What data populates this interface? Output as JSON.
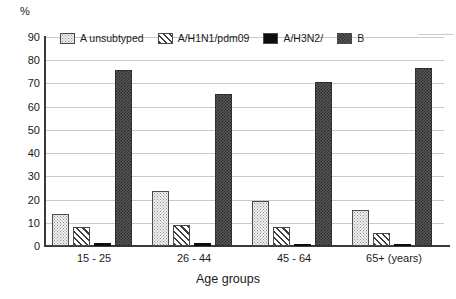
{
  "chart_data": {
    "type": "bar",
    "title": "",
    "subtitle": "",
    "xlabel": "Age groups",
    "ylabel": "%",
    "ylim": [
      0,
      90
    ],
    "ytick_step": 10,
    "yticks": [
      "90",
      "80",
      "70",
      "60",
      "50",
      "40",
      "30",
      "20",
      "10",
      "0"
    ],
    "grid": true,
    "legend_position": "top",
    "categories": [
      "15 - 25",
      "26 - 44",
      "45 - 64",
      "65+ (years)"
    ],
    "series": [
      {
        "name": "A unsubtyped",
        "pattern": "dots-light",
        "color": "#f2f2f2",
        "values": [
          14,
          23.5,
          19.5,
          15.5
        ]
      },
      {
        "name": "A/H1N1/pdm09",
        "pattern": "diagonal-hatch",
        "color": "#ffffff",
        "values": [
          8,
          9,
          8,
          5.5
        ]
      },
      {
        "name": "A/H3N2/",
        "pattern": "solid",
        "color": "#0d0d0d",
        "values": [
          1.5,
          1.2,
          0.6,
          0.6
        ]
      },
      {
        "name": "B",
        "pattern": "dark-checker",
        "color": "#595959",
        "values": [
          76,
          65.5,
          70.5,
          76.5
        ]
      }
    ]
  },
  "axis": {
    "y_unit_label": "%",
    "x_axis_title": "Age groups"
  },
  "legend": {
    "items": [
      {
        "label": "A unsubtyped"
      },
      {
        "label": "A/H1N1/pdm09"
      },
      {
        "label": "A/H3N2/"
      },
      {
        "label": "B"
      }
    ]
  }
}
